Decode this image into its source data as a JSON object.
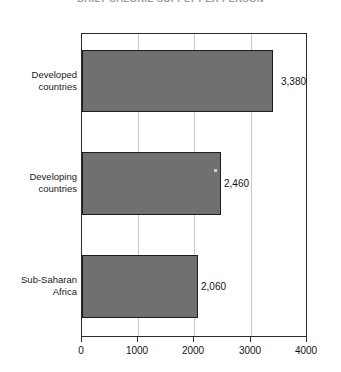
{
  "chart_data": {
    "type": "bar",
    "orientation": "horizontal",
    "title": "DAILY CALORIE SUPPLY PER PERSON",
    "categories": [
      "Developed countries",
      "Developing countries",
      "Sub-Saharan Africa"
    ],
    "values": [
      3380,
      2460,
      2060
    ],
    "value_labels": [
      "3,380",
      "2,460",
      "2,060"
    ],
    "xlabel": "",
    "ylabel": "",
    "xlim": [
      0,
      4000
    ],
    "xticks": [
      0,
      1000,
      2000,
      3000,
      4000
    ],
    "xtick_labels": [
      "0",
      "1000",
      "2000",
      "3000",
      "4000"
    ],
    "grid": "vertical",
    "legend": "none",
    "bar_color": "#707070",
    "bar_edge_color": "#1d1d1d",
    "frame_color": "#2b2b2b",
    "gridline_color": "#c9c9c9",
    "background_color": "#ffffff"
  }
}
